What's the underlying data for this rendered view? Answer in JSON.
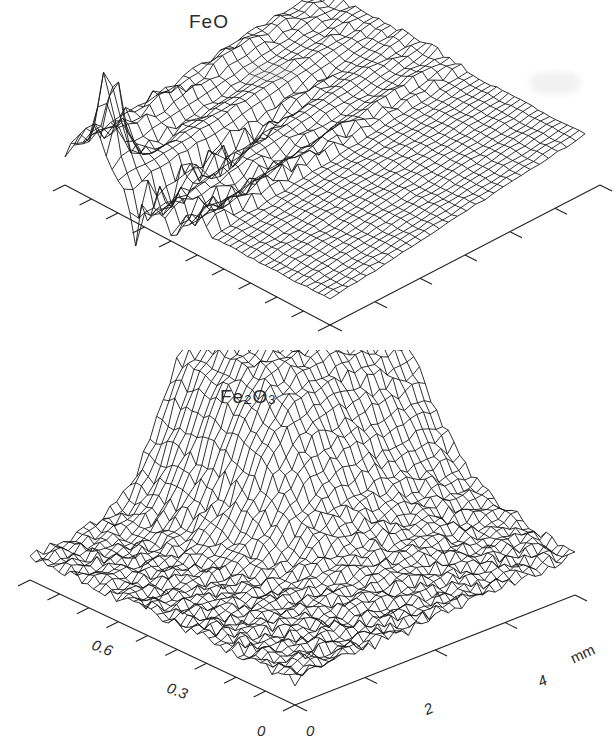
{
  "figure": {
    "panels": [
      {
        "id": "feo",
        "label": "FeO",
        "x_axis_ticks": 10,
        "y_axis_ticks": 5
      },
      {
        "id": "fe2o3",
        "label_main": "Fe",
        "label_sub1": "2",
        "label_mid": "O",
        "label_sub2": "3",
        "left_axis_labels": [
          "0",
          "0.3",
          "0.6"
        ],
        "right_axis_labels": [
          "0",
          "2",
          "4"
        ],
        "right_axis_unit": "mm"
      }
    ]
  },
  "chart_data": [
    {
      "type": "surface",
      "title": "FeO",
      "xlabel": "",
      "ylabel": "",
      "zlabel": "",
      "grid": false,
      "description": "3D wireframe surface of FeO distribution; sharp narrow peak near back-left corner, deep irregular valleys in the front-center region, nearly flat plateau towards the right side",
      "features": [
        {
          "name": "sharp peak",
          "position": "back-left",
          "relative_height": 1.0
        },
        {
          "name": "front valleys",
          "position": "center-front",
          "relative_height": -0.6
        },
        {
          "name": "plateau",
          "position": "right",
          "relative_height": 0.15
        }
      ]
    },
    {
      "type": "surface",
      "title": "Fe2O3",
      "xlabel": "mm",
      "ylabel": "",
      "zlabel": "",
      "x_ticks": [
        0,
        2,
        4
      ],
      "y_ticks": [
        0,
        0.3,
        0.6
      ],
      "grid": false,
      "description": "3D wireframe surface of Fe2O3 distribution; broad ridge rising at back-center forming a high plateau that extends to the right, smooth slope in the middle, rough low-lying terrain at front-left",
      "features": [
        {
          "name": "high ridge",
          "position": "back-center to right",
          "relative_height": 1.0
        },
        {
          "name": "smooth slope",
          "position": "center",
          "relative_height": 0.5
        },
        {
          "name": "rough lowland",
          "position": "front-left",
          "relative_height": 0.1
        }
      ]
    }
  ]
}
